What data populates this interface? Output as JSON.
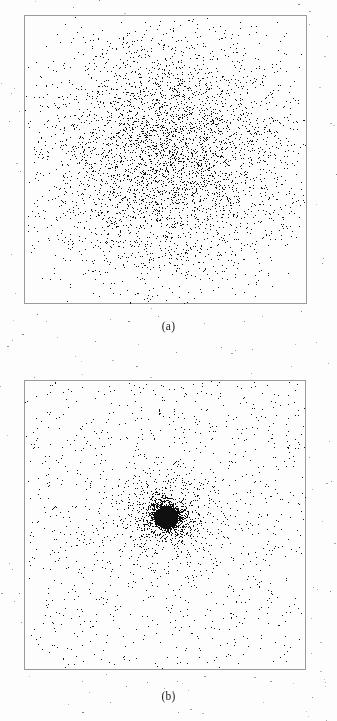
{
  "figure": {
    "width": 337,
    "height": 721,
    "background_color": "#fdfdfd",
    "frame_color": "#9a9a9a",
    "point_color": "#101010",
    "label_color": "#1b1b1b",
    "bleed_text": ""
  },
  "panels": [
    {
      "id": "panel-a",
      "label": "(a)",
      "label_x": 165,
      "label_y": 320,
      "frame": {
        "x": 24,
        "y": 15,
        "width": 283,
        "height": 289
      }
    },
    {
      "id": "panel-b",
      "label": "(b)",
      "label_x": 163,
      "label_y": 690,
      "frame": {
        "x": 24,
        "y": 380,
        "width": 282,
        "height": 290
      }
    }
  ],
  "chart_data": [
    {
      "type": "scatter",
      "panel": "(a)",
      "title": "",
      "xlabel": "",
      "ylabel": "",
      "grid": false,
      "legend": null,
      "axis_ticks": false,
      "xlim": [
        -1,
        1
      ],
      "ylim": [
        -1,
        1
      ],
      "n_points": 4200,
      "marker": {
        "shape": "square",
        "size_px": 1,
        "color": "#101010"
      },
      "distribution": {
        "family": "radial-gaussian-cluster",
        "center_px": [
          166,
          155
        ],
        "center_data": [
          0.0,
          0.0
        ],
        "radial_profile": "gaussian",
        "sigma_px": 62,
        "core_concentration": "moderate",
        "tail": "light",
        "halo_fraction": 0.07,
        "halo_spread_px": 150,
        "description": "Broad, roughly circular Gaussian swarm filling most of the frame; density falls off smoothly from a moderately dark core."
      }
    },
    {
      "type": "scatter",
      "panel": "(b)",
      "title": "",
      "xlabel": "",
      "ylabel": "",
      "grid": false,
      "legend": null,
      "axis_ticks": false,
      "xlim": [
        -1,
        1
      ],
      "ylim": [
        -1,
        1
      ],
      "n_points": 4600,
      "marker": {
        "shape": "square",
        "size_px": 1,
        "color": "#101010"
      },
      "distribution": {
        "family": "radial-cusped-cluster",
        "center_px": [
          166,
          516
        ],
        "center_data": [
          0.0,
          0.0
        ],
        "radial_profile": "power-law",
        "core_radius_px": 11,
        "core_concentration": "very high",
        "tail": "heavy",
        "halo_fraction": 0.3,
        "halo_spread_px": 190,
        "description": "Strongly centrally condensed swarm: a small saturated black core surrounded by an extended sparse halo reaching the frame edges."
      }
    }
  ],
  "artifacts": {
    "speckle_count": 110,
    "speckle_color": "#6a6a6a",
    "description": "Scattered scan-noise specks in the page margins outside both plot frames."
  }
}
